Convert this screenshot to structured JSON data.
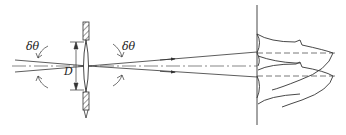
{
  "diagram": {
    "type": "optics-resolution",
    "labels": {
      "angle_left": "δθ",
      "angle_right": "δθ",
      "aperture": "D"
    },
    "elements": [
      {
        "name": "lens",
        "description": "thin convex lens with hatched mount"
      },
      {
        "name": "aperture-dimension",
        "description": "double arrow indicating aperture diameter D"
      },
      {
        "name": "incoming-rays",
        "description": "two converging rays from left"
      },
      {
        "name": "outgoing-rays",
        "description": "two diverging rays to screen"
      },
      {
        "name": "optical-axis",
        "description": "dash-dot center line"
      },
      {
        "name": "screen",
        "description": "vertical observation plane"
      },
      {
        "name": "diffraction-patterns",
        "description": "two overlapping Airy intensity profiles"
      }
    ],
    "colors": {
      "stroke": "#333333",
      "background": "#ffffff"
    }
  }
}
